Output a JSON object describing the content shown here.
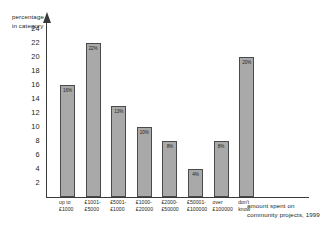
{
  "chart_data": {
    "type": "bar",
    "title": "",
    "xlabel": "amount spent on community projects, 1999",
    "ylabel": "percentage in category",
    "categories": [
      "up to £1000",
      "£1001-£5000",
      "£5001-£10000",
      "£10001-£20000",
      "£20001-£50000",
      "£50001-£100000",
      "over £100000",
      "don't know"
    ],
    "category_lines": [
      [
        "up to",
        "£1000"
      ],
      [
        "£1001-",
        "£5000"
      ],
      [
        "£5001-",
        "£1000"
      ],
      [
        "£1000-",
        "£20000"
      ],
      [
        "£2000-",
        "£50000"
      ],
      [
        "£50001-",
        "£100000"
      ],
      [
        "over",
        "£100000"
      ],
      [
        "don't",
        "know"
      ]
    ],
    "values": [
      16,
      22,
      13,
      10,
      8,
      4,
      8,
      20
    ],
    "value_labels": [
      "16%",
      "22%",
      "13%",
      "10%",
      "8%",
      "4%",
      "8%",
      "20%"
    ],
    "ylim": [
      0,
      25
    ],
    "yticks": [
      24,
      22,
      20,
      18,
      16,
      14,
      12,
      10,
      8,
      6,
      4,
      2
    ],
    "ytick_labels": [
      "24",
      "22",
      "20",
      "18",
      "16",
      "14",
      "12",
      "10",
      "8",
      "6",
      "4",
      "2"
    ],
    "grid": false,
    "legend": false,
    "bar_color": "#a9a9a9",
    "bar_border_color": "#4a4a4a",
    "axis_color": "#3a3a3a",
    "text_color": "#231f20"
  },
  "axes": {
    "y_title_lines": [
      "percentage",
      "in category"
    ],
    "x_title_lines": [
      "amount spent on",
      "community projects, 1999"
    ]
  }
}
